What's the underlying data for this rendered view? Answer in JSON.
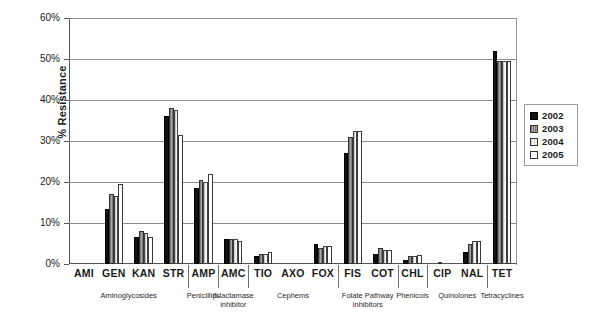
{
  "chart_data": {
    "type": "bar",
    "title": "",
    "xlabel": "",
    "ylabel": "% Resistance",
    "ylim": [
      0,
      60
    ],
    "ytick_labels": [
      "0%",
      "10%",
      "20%",
      "30%",
      "40%",
      "50%",
      "60%"
    ],
    "ytick_values": [
      0,
      10,
      20,
      30,
      40,
      50,
      60
    ],
    "grid": true,
    "legend_position": "right",
    "categories": [
      "AMI",
      "GEN",
      "KAN",
      "STR",
      "AMP",
      "AMC",
      "TIO",
      "AXO",
      "FOX",
      "FIS",
      "COT",
      "CHL",
      "CIP",
      "NAL",
      "TET"
    ],
    "series": [
      {
        "name": "2002",
        "color": "#111111",
        "values": [
          0,
          13.5,
          6.5,
          36.0,
          18.5,
          6.0,
          2.0,
          0,
          5.0,
          27.0,
          2.5,
          1.0,
          0,
          3.0,
          52.0
        ]
      },
      {
        "name": "2003",
        "color": "#8e8e8e",
        "values": [
          0,
          17.0,
          8.0,
          38.0,
          20.5,
          6.2,
          2.5,
          0,
          4.0,
          31.0,
          4.0,
          2.0,
          0.3,
          5.0,
          49.5
        ]
      },
      {
        "name": "2004",
        "color": "#e2e2e2",
        "values": [
          0,
          16.5,
          7.5,
          37.5,
          20.0,
          6.2,
          2.5,
          0,
          4.5,
          32.5,
          3.5,
          2.0,
          0,
          5.5,
          49.5
        ]
      },
      {
        "name": "2005",
        "color": "#ffffff",
        "values": [
          0,
          19.5,
          6.5,
          31.5,
          22.0,
          5.5,
          3.0,
          0,
          4.5,
          32.5,
          3.5,
          2.2,
          0,
          5.5,
          49.5
        ]
      }
    ],
    "class_groups": [
      {
        "label": "Aminoglycosides",
        "drugs": [
          "AMI",
          "GEN",
          "KAN",
          "STR"
        ]
      },
      {
        "label": "Penicillins",
        "drugs": [
          "AMP"
        ]
      },
      {
        "label": "β-lactamase inhibitor",
        "drugs": [
          "AMC"
        ]
      },
      {
        "label": "Cephems",
        "drugs": [
          "TIO",
          "AXO",
          "FOX"
        ]
      },
      {
        "label": "Folate Pathway Inhibitors",
        "drugs": [
          "FIS",
          "COT"
        ]
      },
      {
        "label": "Phenicols",
        "drugs": [
          "CHL"
        ]
      },
      {
        "label": "Quinolones",
        "drugs": [
          "CIP",
          "NAL"
        ]
      },
      {
        "label": "Tetracyclines",
        "drugs": [
          "TET"
        ]
      }
    ]
  },
  "axis": {
    "y_title": "% Resistance"
  },
  "legend": {
    "entries": [
      {
        "label": "2002"
      },
      {
        "label": "2003"
      },
      {
        "label": "2004"
      },
      {
        "label": "2005"
      }
    ]
  }
}
